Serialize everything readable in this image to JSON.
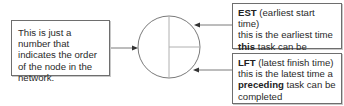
{
  "diagram": {
    "type": "activity-on-node legend",
    "node": {
      "shape": "circle",
      "sections": [
        "node number",
        "EST",
        "LFT"
      ]
    },
    "left_box": {
      "text": "This is just a number that indicates the order of the node in the network."
    },
    "est_box": {
      "term": "EST",
      "term_desc": " (earliest start time)",
      "line2": "this is the earliest time",
      "emph": "this",
      "rest": " task can be started"
    },
    "lft_box": {
      "term": "LFT",
      "term_desc": " (latest finish time)",
      "line2": "this is the latest time a",
      "emph": "preceding",
      "rest": " task can be completed"
    },
    "colors": {
      "line": "#7a7a7a",
      "divider": "#b0b0b0",
      "arrowhead": "#333333",
      "border": "#6e6e6e"
    }
  }
}
